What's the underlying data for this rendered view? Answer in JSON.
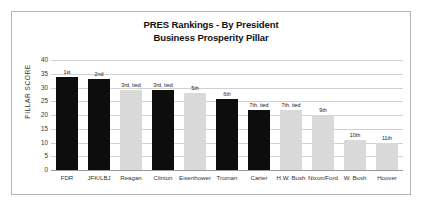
{
  "chart_data": {
    "type": "bar",
    "title": "PRES Rankings - By President Business Prosperity Pillar",
    "title_lines": [
      "PRES Rankings - By President",
      "Business Prosperity Pillar"
    ],
    "xlabel": "",
    "ylabel": "PILLAR SCORE",
    "ylim": [
      0,
      40
    ],
    "ytick_step": 5,
    "yticks": [
      "0",
      "5",
      "10",
      "15",
      "20",
      "25",
      "30",
      "35",
      "40"
    ],
    "grid": true,
    "legend": "none",
    "categories": [
      "FDR",
      "JFK/LBJ",
      "Reagan",
      "Clinton",
      "Eisenhower",
      "Truman",
      "Carter",
      "H.W. Bush",
      "Nixon/Ford",
      "W. Bush",
      "Hoover"
    ],
    "values": [
      34,
      33,
      29,
      29,
      28,
      26,
      22,
      22,
      20,
      11,
      10
    ],
    "annotations": [
      "1st",
      "2nd",
      "3rd, tied",
      "3rd, tied",
      "5th",
      "6th",
      "7th, tied",
      "7th, tied",
      "9th",
      "10th",
      "11th"
    ],
    "bar_colors": [
      "#0d0d0d",
      "#0d0d0d",
      "#d9d9d9",
      "#0d0d0d",
      "#d9d9d9",
      "#0d0d0d",
      "#0d0d0d",
      "#d9d9d9",
      "#d9d9d9",
      "#d9d9d9",
      "#d9d9d9"
    ],
    "colors": {
      "dark_bar": "#0d0d0d",
      "light_bar": "#d9d9d9",
      "gridline": "#d0d0d0",
      "axis": "#9a9a9a",
      "border": "#b5b5b5",
      "background": "#ffffff",
      "text": "#333333"
    }
  }
}
